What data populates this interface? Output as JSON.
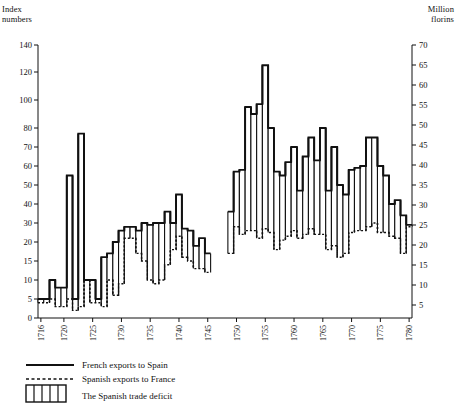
{
  "axes": {
    "left_title_line1": "Index",
    "left_title_line2": "numbers",
    "right_title_line1": "Million",
    "right_title_line2": "florins"
  },
  "legend": {
    "items": [
      {
        "label": "French exports to Spain",
        "style": "solid-line",
        "name": "legend-french-exports"
      },
      {
        "label": "Spanish exports to France",
        "style": "dashed-line",
        "name": "legend-spanish-exports"
      },
      {
        "label": "The Spanish trade deficit",
        "style": "hatched-box",
        "name": "legend-trade-deficit"
      }
    ]
  },
  "chart_data": {
    "type": "line",
    "title": "",
    "xlabel": "",
    "ylabel": "Index numbers",
    "y2label": "Million florins",
    "grid": false,
    "legend_position": "below",
    "xlim": [
      1716,
      1780
    ],
    "ylim": [
      0,
      140
    ],
    "y2lim": [
      5,
      70
    ],
    "y_ticks": [
      0,
      5,
      10,
      15,
      20,
      30,
      40,
      50,
      60,
      70,
      80,
      100,
      120,
      140
    ],
    "y_tick_labels": [
      "0",
      "5",
      "10",
      "15",
      "20",
      "30",
      "40",
      "50",
      "60",
      "70",
      "80",
      "100",
      "120",
      "140"
    ],
    "y_axis_scale": "nonlinear-compressed-above-20",
    "y2_ticks": [
      5,
      10,
      15,
      20,
      25,
      30,
      35,
      40,
      45,
      50,
      55,
      60,
      65,
      70
    ],
    "y2_tick_labels": [
      "5",
      "10",
      "15",
      "20",
      "25",
      "30",
      "35",
      "40",
      "45",
      "50",
      "55",
      "60",
      "65",
      "70"
    ],
    "x_ticks": [
      1716,
      1720,
      1725,
      1730,
      1735,
      1740,
      1745,
      1750,
      1755,
      1760,
      1765,
      1770,
      1775,
      1780
    ],
    "x_tick_labels": [
      "1716",
      "1720",
      "1725",
      "1730",
      "1735",
      "1740",
      "1745",
      "1750",
      "1755",
      "1760",
      "1765",
      "1770",
      "1775",
      "1780"
    ],
    "x": [
      1716,
      1717,
      1718,
      1719,
      1720,
      1721,
      1722,
      1723,
      1724,
      1725,
      1726,
      1727,
      1728,
      1729,
      1730,
      1731,
      1732,
      1733,
      1734,
      1735,
      1736,
      1737,
      1738,
      1739,
      1740,
      1741,
      1742,
      1743,
      1744,
      1745,
      1746,
      1747,
      1748,
      1749,
      1750,
      1751,
      1752,
      1753,
      1754,
      1755,
      1756,
      1757,
      1758,
      1759,
      1760,
      1761,
      1762,
      1763,
      1764,
      1765,
      1766,
      1767,
      1768,
      1769,
      1770,
      1771,
      1772,
      1773,
      1774,
      1775,
      1776,
      1777,
      1778,
      1779,
      1780
    ],
    "series": [
      {
        "name": "French exports to Spain",
        "style": "solid",
        "values": [
          5,
          5,
          10,
          8,
          8,
          55,
          5,
          77,
          10,
          10,
          5,
          16,
          17,
          20,
          26,
          28,
          28,
          26,
          30,
          29,
          30,
          30,
          36,
          30,
          45,
          27,
          26,
          19,
          22,
          17,
          null,
          null,
          null,
          36,
          57,
          58,
          95,
          90,
          97,
          125,
          80,
          57,
          55,
          62,
          70,
          47,
          65,
          75,
          63,
          80,
          47,
          70,
          50,
          45,
          58,
          59,
          60,
          75,
          75,
          60,
          55,
          40,
          42,
          34,
          29
        ]
      },
      {
        "name": "Spanish exports to France",
        "style": "dashed",
        "values": [
          4,
          4,
          5,
          3,
          3,
          5,
          2,
          3,
          10,
          4,
          4,
          3,
          10,
          6,
          9,
          22,
          22,
          17,
          15,
          10,
          9,
          10,
          14,
          18,
          23,
          16,
          15,
          13,
          13,
          12,
          null,
          null,
          null,
          17,
          28,
          24,
          26,
          26,
          22,
          27,
          25,
          18,
          21,
          23,
          26,
          22,
          24,
          27,
          24,
          24,
          18,
          19,
          16,
          17,
          25,
          26,
          26,
          28,
          30,
          25,
          25,
          23,
          22,
          17,
          28
        ]
      }
    ],
    "annotations": [
      {
        "text": "data gap",
        "x_range": [
          1746,
          1748
        ]
      }
    ]
  }
}
